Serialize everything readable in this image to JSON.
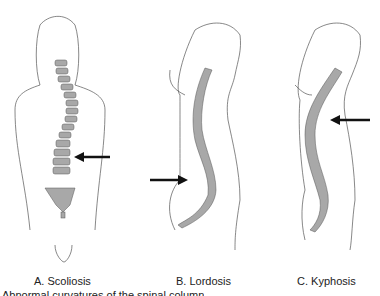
{
  "figure": {
    "panels": [
      {
        "label": "A. Scoliosis",
        "view": "posterior",
        "arrow_direction": "left"
      },
      {
        "label": "B. Lordosis",
        "view": "lateral",
        "arrow_direction": "right"
      },
      {
        "label": "C. Kyphosis",
        "view": "lateral",
        "arrow_direction": "left"
      }
    ],
    "caption_partial": "Abnormal curvatures of the spinal column",
    "colors": {
      "outline": "#555555",
      "vertebra": "#a8a8a8",
      "arrow": "#111111"
    }
  }
}
